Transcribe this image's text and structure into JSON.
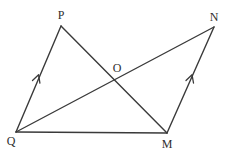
{
  "diagram": {
    "type": "geometry",
    "stroke_color": "#3a3a3a",
    "background": "#ffffff",
    "points": {
      "P": {
        "x": 61,
        "y": 26,
        "label": "P",
        "label_x": 61,
        "label_y": 15
      },
      "N": {
        "x": 214,
        "y": 27,
        "label": "N",
        "label_x": 214,
        "label_y": 17
      },
      "O": {
        "x": 115,
        "y": 78,
        "label": "O",
        "label_x": 117,
        "label_y": 68
      },
      "Q": {
        "x": 16,
        "y": 132,
        "label": "Q",
        "label_x": 11,
        "label_y": 141
      },
      "M": {
        "x": 167,
        "y": 133,
        "label": "M",
        "label_x": 167,
        "label_y": 144
      }
    },
    "segments": [
      {
        "from": "Q",
        "to": "P",
        "parallel_mark": true
      },
      {
        "from": "P",
        "to": "M",
        "parallel_mark": false
      },
      {
        "from": "Q",
        "to": "N",
        "parallel_mark": false
      },
      {
        "from": "Q",
        "to": "M",
        "parallel_mark": false
      },
      {
        "from": "M",
        "to": "N",
        "parallel_mark": true
      }
    ]
  }
}
